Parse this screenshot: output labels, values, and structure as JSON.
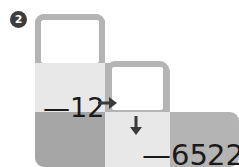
{
  "problem": {
    "number": "②",
    "number_plain": "2"
  },
  "grid": {
    "cells": [
      {
        "name": "top-empty-answer-cell",
        "tone": "white",
        "label": ""
      },
      {
        "name": "operation-cell",
        "tone": "light",
        "label": "—12"
      },
      {
        "name": "middle-empty-answer-cell",
        "tone": "white",
        "label": ""
      },
      {
        "name": "bottom-left-blank-cell",
        "tone": "dark",
        "label": ""
      },
      {
        "name": "result-cell",
        "tone": "light",
        "label": "—65"
      },
      {
        "name": "target-cell",
        "tone": "mid",
        "label": "22"
      }
    ]
  },
  "labels": {
    "operation": "—12",
    "result": "—65",
    "target": "22"
  },
  "icons": {
    "arrow_right": "arrow-right-icon",
    "arrow_down": "arrow-down-icon"
  },
  "answer_boxes": {
    "top": {
      "value": "",
      "placeholder": ""
    },
    "middle": {
      "value": "",
      "placeholder": ""
    }
  },
  "colors": {
    "cell_light": "#e8e8e8",
    "cell_mid": "#b4b4b4",
    "cell_dark": "#a6a6a6",
    "box_border": "#b4b4b4",
    "box_fill": "#ffffff",
    "text": "#1a1a1a",
    "badge_fill": "#3c3c3c",
    "page_background": "#ffffff"
  }
}
